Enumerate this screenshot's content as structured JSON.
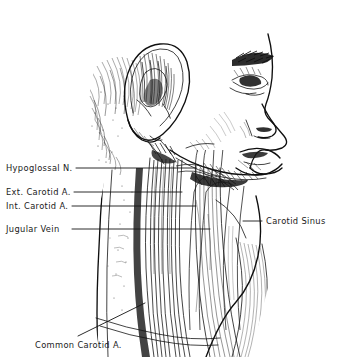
{
  "figure": {
    "medium": "pen-and-ink anatomical illustration",
    "view": "right lateral head and neck, profile facing right",
    "background_color": "#ffffff",
    "ink_color": "#121212",
    "width": 337,
    "height": 357
  },
  "labels": [
    {
      "id": "hypoglossal-nerve",
      "text": "Hypoglossal N.",
      "text_x": 6,
      "text_y": 168,
      "leader": {
        "x1": 76,
        "y1": 168,
        "x2": 196,
        "y2": 168
      }
    },
    {
      "id": "external-carotid-artery",
      "text": "Ext. Carotid A.",
      "text_x": 6,
      "text_y": 192,
      "leader": {
        "x1": 74,
        "y1": 192,
        "x2": 182,
        "y2": 192
      }
    },
    {
      "id": "internal-carotid-artery",
      "text": "Int. Carotid A.",
      "text_x": 6,
      "text_y": 206,
      "leader": {
        "x1": 72,
        "y1": 206,
        "x2": 196,
        "y2": 206
      }
    },
    {
      "id": "jugular-vein",
      "text": "Jugular Vein",
      "text_x": 6,
      "text_y": 229,
      "leader": {
        "x1": 72,
        "y1": 229,
        "x2": 210,
        "y2": 229
      }
    },
    {
      "id": "carotid-sinus",
      "text": "Carotid Sinus",
      "text_x": 266,
      "text_y": 221,
      "leader": {
        "x1": 243,
        "y1": 221,
        "x2": 262,
        "y2": 221
      }
    },
    {
      "id": "common-carotid-artery",
      "text": "Common Carotid A.",
      "text_x": 35,
      "text_y": 345,
      "leader": {
        "x1": 78,
        "y1": 336,
        "x2": 145,
        "y2": 303
      }
    }
  ],
  "anatomy_regions": [
    {
      "id": "ear-auricle",
      "description": "external ear with helix, antihelix and concha"
    },
    {
      "id": "face-profile",
      "description": "brow, eye, nose, lips and chin in right profile"
    },
    {
      "id": "scalp-hair",
      "description": "stippled hair and temporal scalp texture"
    },
    {
      "id": "mandible-border",
      "description": "lower jaw border with submandibular tissue"
    },
    {
      "id": "parotid-region",
      "description": "parotid and upper cervical dissection field"
    },
    {
      "id": "sternocleidomastoid",
      "description": "striated sternocleidomastoid muscle belly"
    },
    {
      "id": "carotid-sheath",
      "description": "carotid vessels and internal jugular vein"
    },
    {
      "id": "neck-base",
      "description": "clavicular and supraclavicular region"
    }
  ]
}
